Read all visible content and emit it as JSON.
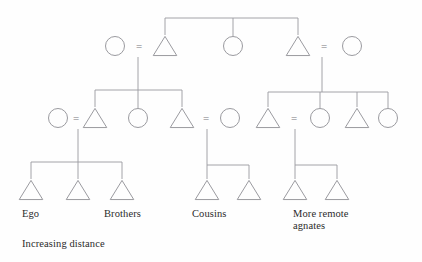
{
  "figure": {
    "kind": "kinship-diagram",
    "title_visible": false,
    "canvas": {
      "width": 422,
      "height": 262
    },
    "background_color": "#fefefe",
    "line_color": "#9a9a9f",
    "shape_stroke_color": "#8f8f94",
    "text_color": "#2b2b2b"
  },
  "legend": {
    "symbols": [
      {
        "glyph": "triangle",
        "meaning": "male"
      },
      {
        "glyph": "circle",
        "meaning": "female"
      },
      {
        "glyph": "equals",
        "meaning": "marriage union"
      }
    ]
  },
  "nodes": [
    {
      "id": "g1-f1",
      "shape": "circle",
      "sex": "female",
      "cx": 115,
      "cy": 46,
      "r": 9.5,
      "generation": 1
    },
    {
      "id": "g1-m1",
      "shape": "triangle",
      "sex": "male",
      "cx": 165,
      "cy": 46,
      "r": 10.5,
      "generation": 1
    },
    {
      "id": "g1-f2",
      "shape": "circle",
      "sex": "female",
      "cx": 233,
      "cy": 46,
      "r": 9.5,
      "generation": 1
    },
    {
      "id": "g1-m2",
      "shape": "triangle",
      "sex": "male",
      "cx": 298,
      "cy": 46,
      "r": 10.5,
      "generation": 1
    },
    {
      "id": "g1-f3",
      "shape": "circle",
      "sex": "female",
      "cx": 352,
      "cy": 46,
      "r": 9.5,
      "generation": 1
    },
    {
      "id": "g2-f1",
      "shape": "circle",
      "sex": "female",
      "cx": 58,
      "cy": 118,
      "r": 9.5,
      "generation": 2
    },
    {
      "id": "g2-m1",
      "shape": "triangle",
      "sex": "male",
      "cx": 95,
      "cy": 118,
      "r": 10.5,
      "generation": 2
    },
    {
      "id": "g2-f2",
      "shape": "circle",
      "sex": "female",
      "cx": 138,
      "cy": 118,
      "r": 9.5,
      "generation": 2
    },
    {
      "id": "g2-m2",
      "shape": "triangle",
      "sex": "male",
      "cx": 182,
      "cy": 118,
      "r": 10.5,
      "generation": 2
    },
    {
      "id": "g2-f3",
      "shape": "circle",
      "sex": "female",
      "cx": 230,
      "cy": 118,
      "r": 9.5,
      "generation": 2
    },
    {
      "id": "g2-m3",
      "shape": "triangle",
      "sex": "male",
      "cx": 268,
      "cy": 118,
      "r": 10.5,
      "generation": 2
    },
    {
      "id": "g2-f4",
      "shape": "circle",
      "sex": "female",
      "cx": 320,
      "cy": 118,
      "r": 9.5,
      "generation": 2
    },
    {
      "id": "g2-m4",
      "shape": "triangle",
      "sex": "male",
      "cx": 357,
      "cy": 118,
      "r": 10.5,
      "generation": 2
    },
    {
      "id": "g2-f5",
      "shape": "circle",
      "sex": "female",
      "cx": 388,
      "cy": 118,
      "r": 9.5,
      "generation": 2
    },
    {
      "id": "g3-m1",
      "shape": "triangle",
      "sex": "male",
      "cx": 31,
      "cy": 190,
      "r": 10.5,
      "generation": 3
    },
    {
      "id": "g3-m2",
      "shape": "triangle",
      "sex": "male",
      "cx": 78,
      "cy": 190,
      "r": 10.5,
      "generation": 3
    },
    {
      "id": "g3-m3",
      "shape": "triangle",
      "sex": "male",
      "cx": 122,
      "cy": 190,
      "r": 10.5,
      "generation": 3
    },
    {
      "id": "g3-m4",
      "shape": "triangle",
      "sex": "male",
      "cx": 207,
      "cy": 190,
      "r": 10.5,
      "generation": 3
    },
    {
      "id": "g3-m5",
      "shape": "triangle",
      "sex": "male",
      "cx": 249,
      "cy": 190,
      "r": 10.5,
      "generation": 3
    },
    {
      "id": "g3-m6",
      "shape": "triangle",
      "sex": "male",
      "cx": 295,
      "cy": 190,
      "r": 10.5,
      "generation": 3
    },
    {
      "id": "g3-m7",
      "shape": "triangle",
      "sex": "male",
      "cx": 337,
      "cy": 190,
      "r": 10.5,
      "generation": 3
    }
  ],
  "unions": [
    {
      "id": "u-g1-a",
      "label": "=",
      "x": 139,
      "y": 47
    },
    {
      "id": "u-g1-b",
      "label": "=",
      "x": 324,
      "y": 47
    },
    {
      "id": "u-g2-a",
      "label": "=",
      "x": 76,
      "y": 119
    },
    {
      "id": "u-g2-b",
      "label": "=",
      "x": 206,
      "y": 119
    },
    {
      "id": "u-g2-c",
      "label": "=",
      "x": 294,
      "y": 119
    }
  ],
  "links": [
    {
      "id": "sib-bar-g1",
      "type": "sibship-bar",
      "points": "165,18 298,18"
    },
    {
      "id": "stem-g1-m1",
      "type": "descent",
      "points": "165,18 165,35"
    },
    {
      "id": "stem-g1-f2",
      "type": "descent",
      "points": "233,18 233,36"
    },
    {
      "id": "stem-g1-m2",
      "type": "descent",
      "points": "298,18 298,35"
    },
    {
      "id": "drop-g1-left",
      "type": "descent",
      "points": "138,57 138,90"
    },
    {
      "id": "sib-bar-g2-left",
      "type": "sibship-bar",
      "points": "95,90 182,90"
    },
    {
      "id": "stem-g2-m1",
      "type": "descent",
      "points": "95,90 95,107"
    },
    {
      "id": "stem-g2-f2",
      "type": "descent",
      "points": "138,90 138,108"
    },
    {
      "id": "stem-g2-m2",
      "type": "descent",
      "points": "182,90 182,107"
    },
    {
      "id": "drop-g1-right",
      "type": "descent",
      "points": "322,57 322,92"
    },
    {
      "id": "sib-bar-g2-right",
      "type": "sibship-bar",
      "points": "268,92 388,92"
    },
    {
      "id": "stem-g2-m3",
      "type": "descent",
      "points": "268,92 268,107"
    },
    {
      "id": "stem-g2-f4",
      "type": "descent",
      "points": "320,92 320,108"
    },
    {
      "id": "stem-g2-m4",
      "type": "descent",
      "points": "357,92 357,107"
    },
    {
      "id": "stem-g2-f5",
      "type": "descent",
      "points": "388,92 388,108"
    },
    {
      "id": "drop-g2-ego",
      "type": "descent",
      "points": "78,129 78,162"
    },
    {
      "id": "sib-bar-g3-ego",
      "type": "sibship-bar",
      "points": "31,162 122,162"
    },
    {
      "id": "stem-g3-m1",
      "type": "descent",
      "points": "31,162 31,179"
    },
    {
      "id": "stem-g3-m2",
      "type": "descent",
      "points": "78,162 78,179"
    },
    {
      "id": "stem-g3-m3",
      "type": "descent",
      "points": "122,162 122,179"
    },
    {
      "id": "drop-g2-cousins",
      "type": "descent",
      "points": "207,129 207,165"
    },
    {
      "id": "sib-bar-g3-cousins",
      "type": "sibship-bar",
      "points": "207,165 249,165"
    },
    {
      "id": "stem-g3-m4",
      "type": "descent",
      "points": "207,165 207,179"
    },
    {
      "id": "stem-g3-m5",
      "type": "descent",
      "points": "249,165 249,179"
    },
    {
      "id": "drop-g2-agnates",
      "type": "descent",
      "points": "295,129 295,165"
    },
    {
      "id": "sib-bar-g3-agnates",
      "type": "sibship-bar",
      "points": "295,165 337,165"
    },
    {
      "id": "stem-g3-m6",
      "type": "descent",
      "points": "295,165 295,179"
    },
    {
      "id": "stem-g3-m7",
      "type": "descent",
      "points": "337,165 337,179"
    }
  ],
  "labels": [
    {
      "id": "label-ego",
      "text": "Ego",
      "x": 22,
      "y": 208
    },
    {
      "id": "label-brothers",
      "text": "Brothers",
      "x": 104,
      "y": 208
    },
    {
      "id": "label-cousins",
      "text": "Cousins",
      "x": 192,
      "y": 208
    },
    {
      "id": "label-agnates",
      "text": "More remote\nagnates",
      "x": 293,
      "y": 208
    }
  ],
  "caption": {
    "id": "caption-increasing-distance",
    "text": "Increasing distance",
    "x": 22,
    "y": 238
  }
}
